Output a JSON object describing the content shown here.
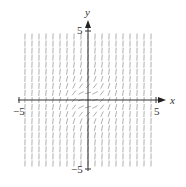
{
  "chart_data": {
    "type": "slope-field",
    "title": "",
    "equation_inferred": "dy/dx = x^2 + y^2",
    "xlabel": "x",
    "ylabel": "y",
    "xlim": [
      -5,
      5
    ],
    "ylim": [
      -5,
      5
    ],
    "x_tick_labels": [
      "-5",
      "5"
    ],
    "y_tick_labels": [
      "5",
      "-5"
    ],
    "grid": false,
    "legend": null,
    "field": {
      "x_range": [
        -4.6,
        4.6
      ],
      "y_range": [
        -4.6,
        4.6
      ],
      "columns": 19,
      "rows": 19,
      "segment_color": "#9a9a9a",
      "notes": "All slopes positive; shallowest near origin, near-vertical far from origin"
    },
    "axis_color": "#333333"
  },
  "labels": {
    "x_axis": "x",
    "y_axis": "y",
    "x_min": "−5",
    "x_max": "5",
    "y_max": "5",
    "y_min": "−5"
  }
}
